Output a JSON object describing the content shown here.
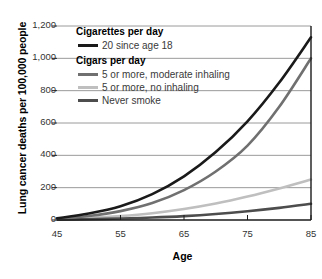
{
  "chart_data": {
    "type": "line",
    "title": "",
    "xlabel": "Age",
    "ylabel": "Lung cancer deaths per 100,000 people",
    "xlim": [
      45,
      85
    ],
    "ylim": [
      0,
      1200
    ],
    "xticks": [
      "45",
      "55",
      "65",
      "75",
      "85"
    ],
    "xtick_values": [
      45,
      55,
      65,
      75,
      85
    ],
    "yticks": [
      "0",
      "200",
      "400",
      "600",
      "800",
      "1,000",
      "1,200"
    ],
    "ytick_values": [
      0,
      200,
      400,
      600,
      800,
      1000,
      1200
    ],
    "grid": "horizontal",
    "legend_position": "upper-left-inside",
    "x": [
      45,
      50,
      55,
      60,
      65,
      70,
      75,
      80,
      85
    ],
    "series": [
      {
        "name": "20 since age 18",
        "group": "Cigarettes per day",
        "color": "#1a1a1a",
        "values": [
          10,
          40,
          85,
          160,
          270,
          420,
          610,
          850,
          1130
        ]
      },
      {
        "name": "5 or more, moderate inhaling",
        "group": "Cigars per day",
        "color": "#707070",
        "values": [
          8,
          25,
          55,
          105,
          185,
          300,
          460,
          700,
          1000
        ]
      },
      {
        "name": "5 or more, no inhaling",
        "group": "Cigars per day",
        "color": "#bfbfbf",
        "values": [
          5,
          12,
          24,
          42,
          68,
          102,
          145,
          195,
          250
        ]
      },
      {
        "name": "Never smoke",
        "group": "Cigars per day",
        "color": "#4d4d4d",
        "values": [
          2,
          5,
          9,
          15,
          24,
          37,
          54,
          75,
          100
        ]
      }
    ]
  },
  "legend": {
    "groups": [
      {
        "heading": "Cigarettes per day",
        "entries": [
          {
            "label": "20 since age 18",
            "color": "#1a1a1a"
          }
        ]
      },
      {
        "heading": "Cigars per day",
        "entries": [
          {
            "label": "5 or more, moderate inhaling",
            "color": "#707070"
          },
          {
            "label": "5 or more, no inhaling",
            "color": "#bfbfbf"
          },
          {
            "label": "Never smoke",
            "color": "#4d4d4d"
          }
        ]
      }
    ]
  },
  "colors": {
    "background": "#ffffff",
    "grid": "#9a9a9a",
    "axis": "#1a1a1a",
    "tick_text": "#333333",
    "label_text": "#000000"
  }
}
